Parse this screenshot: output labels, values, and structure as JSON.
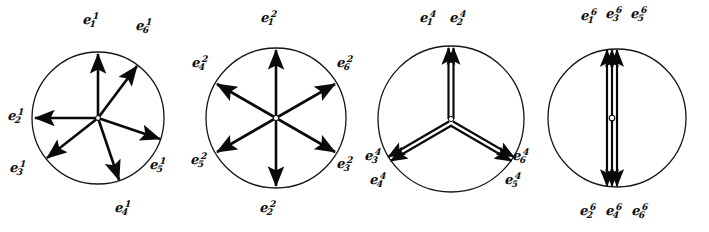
{
  "figure": {
    "background_color": "#ffffff",
    "ink_color": "#0a0a0a",
    "panel_count": 4
  },
  "panels": [
    {
      "id": "panel-1",
      "superscript": "1",
      "circle": {
        "cx": 98,
        "cy": 118,
        "r": 66
      },
      "arrow_style": "single",
      "vector_count": 6,
      "vectors": [
        {
          "name": "e1",
          "sub": "1",
          "sup": "1",
          "angle_deg": 90,
          "label_x": 83,
          "label_y": 12,
          "label": "e"
        },
        {
          "name": "e2",
          "sub": "2",
          "sup": "1",
          "angle_deg": 180,
          "label_x": 8,
          "label_y": 108,
          "label": "e"
        },
        {
          "name": "e3",
          "sub": "3",
          "sup": "1",
          "angle_deg": 218,
          "label_x": 10,
          "label_y": 160,
          "label": "e"
        },
        {
          "name": "e4",
          "sub": "4",
          "sup": "1",
          "angle_deg": 289,
          "label_x": 115,
          "label_y": 200,
          "label": "e"
        },
        {
          "name": "e5",
          "sub": "5",
          "sup": "1",
          "angle_deg": 341,
          "label_x": 150,
          "label_y": 157,
          "label": "e"
        },
        {
          "name": "e6",
          "sub": "6",
          "sup": "1",
          "angle_deg": 54,
          "label_x": 136,
          "label_y": 18,
          "label": "e"
        }
      ]
    },
    {
      "id": "panel-2",
      "superscript": "2",
      "circle": {
        "cx": 276,
        "cy": 118,
        "r": 70
      },
      "arrow_style": "single",
      "vector_count": 6,
      "vectors": [
        {
          "name": "e1",
          "sub": "1",
          "sup": "2",
          "angle_deg": 90,
          "label_x": 261,
          "label_y": 10,
          "label": "e"
        },
        {
          "name": "e2",
          "sub": "2",
          "sup": "2",
          "angle_deg": 270,
          "label_x": 260,
          "label_y": 200,
          "label": "e"
        },
        {
          "name": "e3",
          "sub": "3",
          "sup": "2",
          "angle_deg": 330,
          "label_x": 337,
          "label_y": 156,
          "label": "e"
        },
        {
          "name": "e4",
          "sub": "4",
          "sup": "2",
          "angle_deg": 150,
          "label_x": 192,
          "label_y": 55,
          "label": "e"
        },
        {
          "name": "e5",
          "sub": "5",
          "sup": "2",
          "angle_deg": 210,
          "label_x": 191,
          "label_y": 152,
          "label": "e"
        },
        {
          "name": "e6",
          "sub": "6",
          "sup": "2",
          "angle_deg": 30,
          "label_x": 337,
          "label_y": 55,
          "label": "e"
        }
      ]
    },
    {
      "id": "panel-3",
      "superscript": "4",
      "circle": {
        "cx": 451,
        "cy": 119,
        "r": 73
      },
      "arrow_style": "double",
      "vector_count": 6,
      "vectors": [
        {
          "name": "e1",
          "sub": "1",
          "sup": "4",
          "angle_deg": 90,
          "label_x": 420,
          "label_y": 10,
          "label": "e"
        },
        {
          "name": "e2",
          "sub": "2",
          "sup": "4",
          "angle_deg": 90,
          "label_x": 450,
          "label_y": 10,
          "label": "e"
        },
        {
          "name": "e3",
          "sub": "3",
          "sup": "4",
          "angle_deg": 210,
          "label_x": 365,
          "label_y": 148,
          "label": "e"
        },
        {
          "name": "e4",
          "sub": "4",
          "sup": "4",
          "angle_deg": 210,
          "label_x": 370,
          "label_y": 172,
          "label": "e"
        },
        {
          "name": "e5",
          "sub": "5",
          "sup": "4",
          "angle_deg": 330,
          "label_x": 505,
          "label_y": 172,
          "label": "e"
        },
        {
          "name": "e6",
          "sub": "6",
          "sup": "4",
          "angle_deg": 330,
          "label_x": 513,
          "label_y": 148,
          "label": "e"
        }
      ]
    },
    {
      "id": "panel-4",
      "superscript": "6",
      "circle": {
        "cx": 617,
        "cy": 118,
        "r": 69
      },
      "arrow_style": "collinear",
      "vector_count": 6,
      "vectors": [
        {
          "name": "e1",
          "sub": "1",
          "sup": "6",
          "angle_deg": 90,
          "label_x": 581,
          "label_y": 8,
          "label": "e"
        },
        {
          "name": "e3",
          "sub": "3",
          "sup": "6",
          "angle_deg": 90,
          "label_x": 606,
          "label_y": 6,
          "label": "e"
        },
        {
          "name": "e5",
          "sub": "5",
          "sup": "6",
          "angle_deg": 90,
          "label_x": 631,
          "label_y": 6,
          "label": "e"
        },
        {
          "name": "e2",
          "sub": "2",
          "sup": "6",
          "angle_deg": 270,
          "label_x": 580,
          "label_y": 203,
          "label": "e"
        },
        {
          "name": "e4",
          "sub": "4",
          "sup": "6",
          "angle_deg": 270,
          "label_x": 606,
          "label_y": 203,
          "label": "e"
        },
        {
          "name": "e6",
          "sub": "6",
          "sup": "6",
          "angle_deg": 270,
          "label_x": 632,
          "label_y": 203,
          "label": "e"
        }
      ]
    }
  ]
}
